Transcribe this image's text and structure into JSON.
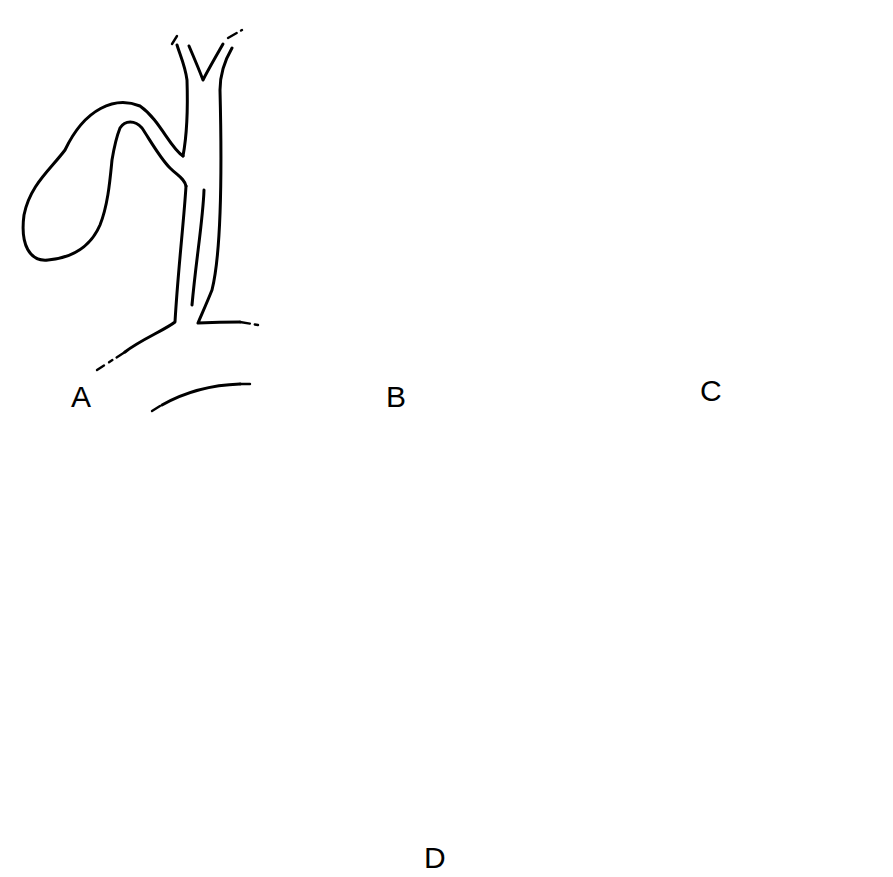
{
  "figure": {
    "panels": [
      {
        "id": "A",
        "label": "A"
      },
      {
        "id": "B",
        "label": "B"
      },
      {
        "id": "C",
        "label": "C"
      },
      {
        "id": "D",
        "label": "D"
      }
    ],
    "colors": {
      "line": "#000000",
      "background": "#ffffff",
      "stone_fill": "#222222"
    }
  }
}
